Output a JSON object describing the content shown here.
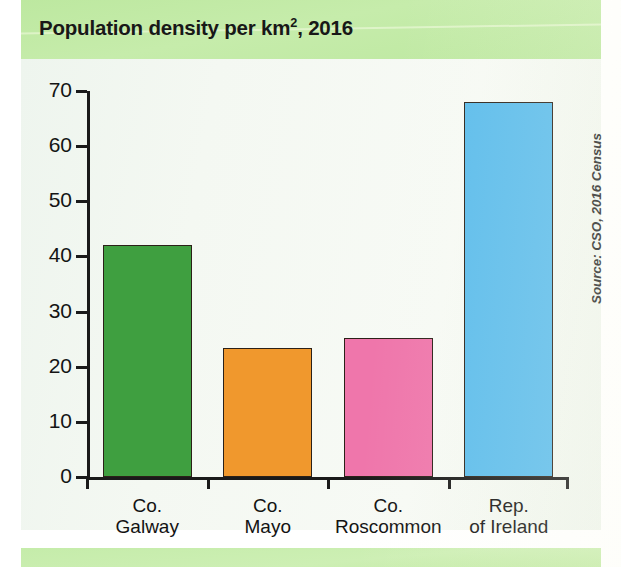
{
  "chart_data": {
    "type": "bar",
    "title_main": "Population density per km",
    "title_sup": "2",
    "title_tail": ", 2016",
    "categories": [
      "Co. Galway",
      "Co. Mayo",
      "Co. Roscommon",
      "Rep. of Ireland"
    ],
    "category_lines": [
      [
        "Co.",
        "Galway"
      ],
      [
        "Co.",
        "Mayo"
      ],
      [
        "Co.",
        "Roscommon"
      ],
      [
        "Rep.",
        "of Ireland"
      ]
    ],
    "values": [
      42,
      23.4,
      25.2,
      68
    ],
    "bar_colors": [
      "#3f9f40",
      "#f0982d",
      "#ef76ab",
      "#5bbcec"
    ],
    "xlabel": "",
    "ylabel": "",
    "ylim": [
      0,
      70
    ],
    "yticks": [
      0,
      10,
      20,
      30,
      40,
      50,
      60,
      70
    ],
    "ytick_labels": [
      "0",
      "10",
      "20",
      "30",
      "40",
      "50",
      "60",
      "70"
    ],
    "grid": false,
    "legend": "none",
    "annotation": "Source: CSO, 2016 Census"
  },
  "colors": {
    "title_band": "#c2eaa5",
    "plot_background": "#f2f7f0",
    "axis": "#1a1a1a",
    "bar_green": "#3f9f40",
    "bar_orange": "#f0982d",
    "bar_pink": "#ef76ab",
    "bar_blue": "#5bbcec"
  }
}
